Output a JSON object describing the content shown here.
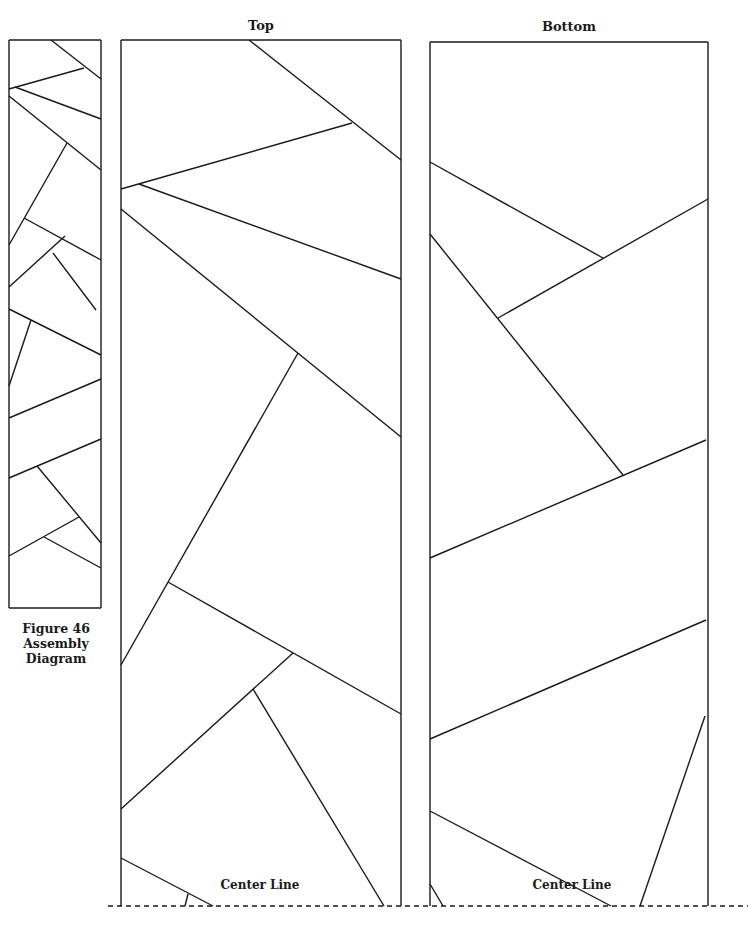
{
  "figure": {
    "caption_lines": [
      "Figure 46",
      "Assembly",
      "Diagram"
    ],
    "panels": [
      {
        "id": "top",
        "title": "Top",
        "center_label": "Center Line"
      },
      {
        "id": "bottom",
        "title": "Bottom",
        "center_label": "Center Line"
      }
    ],
    "colors": {
      "line": "#1a1a1a",
      "background": "#ffffff"
    }
  },
  "geometry": {
    "assembly": {
      "box": [
        9,
        40,
        101,
        608
      ],
      "lines": [
        [
          51,
          40,
          101,
          79
        ],
        [
          9,
          89,
          84,
          68
        ],
        [
          15,
          87,
          101,
          119
        ],
        [
          9,
          96,
          101,
          170
        ],
        [
          67,
          143,
          9,
          245
        ],
        [
          24,
          218,
          101,
          260
        ],
        [
          65,
          236,
          9,
          287
        ],
        [
          53,
          253,
          96,
          310
        ],
        [
          9,
          309,
          101,
          355
        ],
        [
          31,
          320,
          9,
          386
        ],
        [
          101,
          379,
          9,
          418
        ],
        [
          101,
          439,
          9,
          478
        ],
        [
          37,
          466,
          101,
          543
        ],
        [
          79,
          517,
          9,
          556
        ],
        [
          44,
          537,
          101,
          568
        ]
      ]
    },
    "top": {
      "box": [
        121,
        40,
        401,
        906
      ],
      "lines": [
        [
          249,
          40,
          401,
          160
        ],
        [
          121,
          189,
          352,
          123
        ],
        [
          139,
          184,
          401,
          279
        ],
        [
          121,
          209,
          401,
          437
        ],
        [
          298,
          353,
          121,
          665
        ],
        [
          168,
          582,
          401,
          714
        ],
        [
          293,
          653,
          121,
          809
        ],
        [
          253,
          689,
          384,
          906
        ],
        [
          121,
          858,
          213,
          906
        ],
        [
          188,
          894,
          185,
          906
        ]
      ]
    },
    "bottom": {
      "box": [
        430,
        42,
        708,
        906
      ],
      "lines": [
        [
          430,
          162,
          603,
          258
        ],
        [
          708,
          199,
          498,
          318
        ],
        [
          430,
          234,
          623,
          475
        ],
        [
          706,
          440,
          430,
          558
        ],
        [
          706,
          620,
          430,
          739
        ],
        [
          430,
          811,
          611,
          906
        ],
        [
          705,
          716,
          640,
          906
        ],
        [
          430,
          884,
          443,
          906
        ]
      ]
    },
    "center_line": {
      "y": 906,
      "x1": 108,
      "x2": 748
    }
  }
}
